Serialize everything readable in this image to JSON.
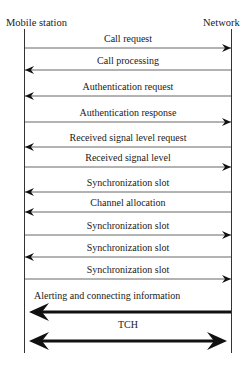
{
  "diagram": {
    "type": "sequence",
    "participants": [
      {
        "name": "Mobile station",
        "x": 24
      },
      {
        "name": "Network",
        "x": 231
      }
    ],
    "messages": [
      {
        "label": "Call request",
        "direction": "right",
        "y": 48,
        "weight": "thin"
      },
      {
        "label": "Call processing",
        "direction": "left",
        "y": 70,
        "weight": "thin"
      },
      {
        "label": "Authentication request",
        "direction": "left",
        "y": 96,
        "weight": "thin"
      },
      {
        "label": "Authentication response",
        "direction": "right",
        "y": 122,
        "weight": "thin"
      },
      {
        "label": "Received signal level request",
        "direction": "left",
        "y": 147,
        "weight": "thin"
      },
      {
        "label": "Received signal level",
        "direction": "right",
        "y": 167,
        "weight": "thin"
      },
      {
        "label": "Synchronization slot",
        "direction": "left",
        "y": 192,
        "weight": "thin"
      },
      {
        "label": "Channel allocation",
        "direction": "left",
        "y": 212,
        "weight": "thin"
      },
      {
        "label": "Synchronization slot",
        "direction": "right",
        "y": 235,
        "weight": "thin"
      },
      {
        "label": "Synchronization slot",
        "direction": "left",
        "y": 257,
        "weight": "thin"
      },
      {
        "label": "Synchronization slot",
        "direction": "right",
        "y": 279,
        "weight": "thin"
      },
      {
        "label": "Alerting and connecting information",
        "direction": "left",
        "y": 312,
        "weight": "thick"
      },
      {
        "label": "TCH",
        "direction": "both",
        "y": 341,
        "weight": "thick"
      }
    ]
  }
}
